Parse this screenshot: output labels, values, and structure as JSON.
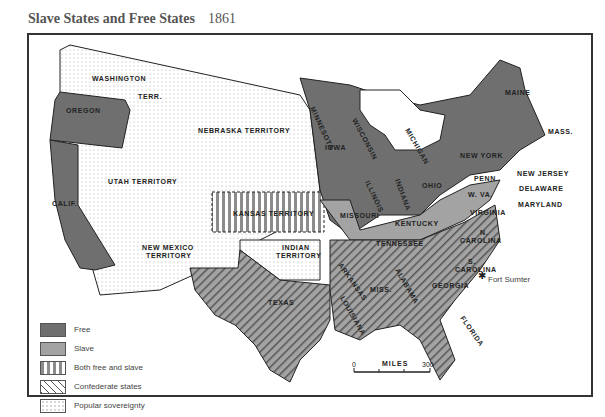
{
  "header": {
    "title": "Slave States and Free States",
    "year": "1861"
  },
  "colors": {
    "free": "#6f6f6f",
    "slave": "#a3a3a3",
    "line": "#222222",
    "stripe": "#8c8c8c"
  },
  "labels": {
    "washington": "WASHINGTON",
    "terr": "TERR.",
    "oregon": "OREGON",
    "nebraska": "NEBRASKA TERRITORY",
    "utah": "UTAH TERRITORY",
    "calif": "CALIF.",
    "newmexico1": "NEW MEXICO",
    "newmexico2": "TERRITORY",
    "kansas": "KANSAS TERRITORY",
    "indian1": "INDIAN",
    "indian2": "TERRITORY",
    "texas": "TEXAS",
    "minnesota": "MINNESOTA",
    "wisconsin": "WISCONSIN",
    "iowa": "IOWA",
    "illinois": "ILLINOIS",
    "indiana": "INDIANA",
    "michigan": "MICHIGAN",
    "ohio": "OHIO",
    "missouri": "MISSOURI",
    "kentucky": "KENTUCKY",
    "tennessee": "TENNESSEE",
    "arkansas": "ARKANSAS",
    "louisiana": "LOUISIANA",
    "miss": "MISS.",
    "alabama": "ALABAMA",
    "georgia": "GEORGIA",
    "florida": "FLORIDA",
    "ncarolina1": "N.",
    "ncarolina2": "CAROLINA",
    "scarolina1": "S.",
    "scarolina2": "CAROLINA",
    "virginia": "VIRGINIA",
    "wva": "W. VA.",
    "maryland": "MARYLAND",
    "delaware": "DELAWARE",
    "newjersey": "NEW JERSEY",
    "penn": "PENN.",
    "newyork": "NEW YORK",
    "maine": "MAINE",
    "mass": "MASS.",
    "vt": "V",
    "nh": "N H",
    "ri": "R.I.",
    "conn": "CONN."
  },
  "annotation": {
    "fort_sumter": "Fort Sumter"
  },
  "legend": [
    {
      "key": "free",
      "label": "Free"
    },
    {
      "key": "slave",
      "label": "Slave"
    },
    {
      "key": "both",
      "label": "Both free and slave"
    },
    {
      "key": "confederate",
      "label": "Confederate states"
    },
    {
      "key": "popular",
      "label": "Popular sovereignty"
    }
  ],
  "scale": {
    "start": "0",
    "unit": "MILES",
    "end": "300"
  }
}
